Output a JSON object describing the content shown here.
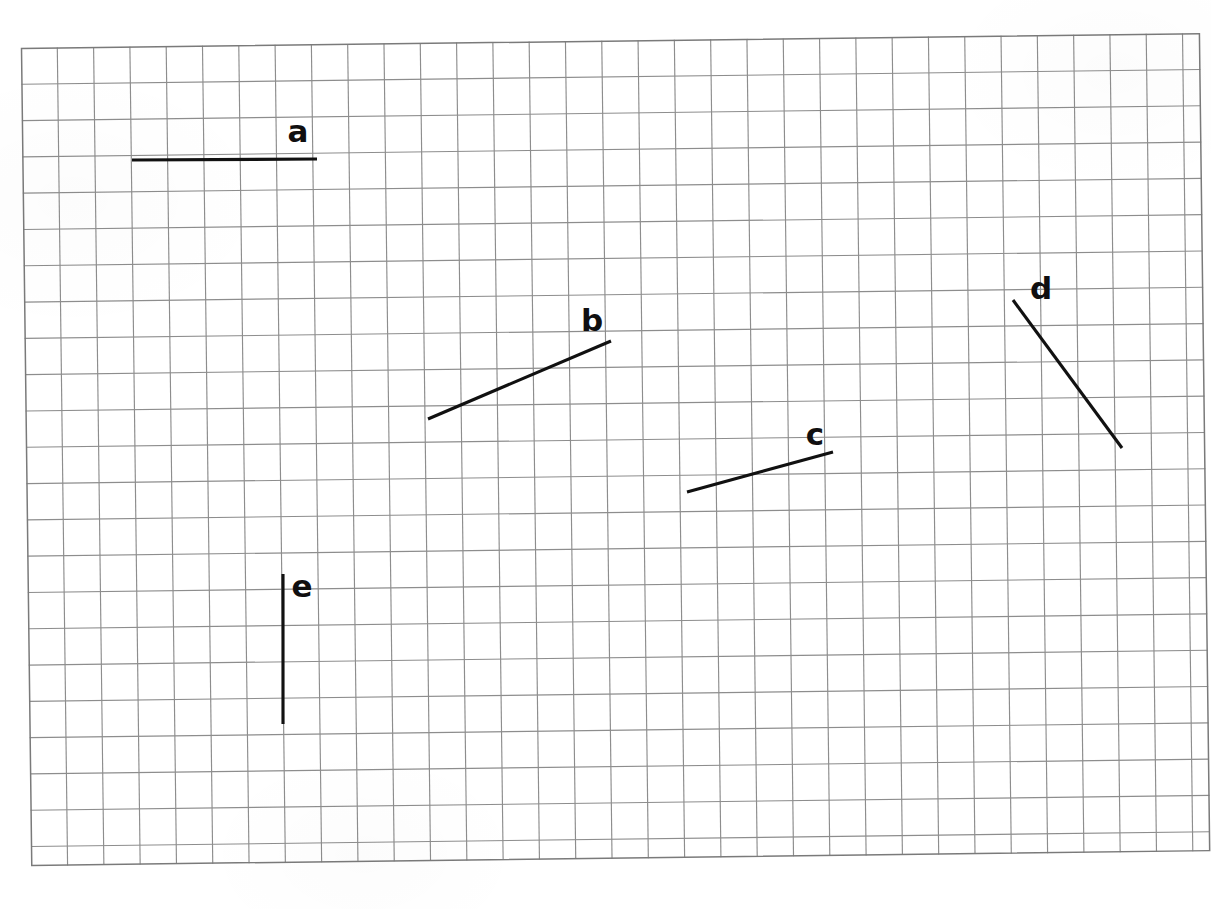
{
  "worksheet": {
    "background_color": "#ffffff",
    "description": "Grid paper with five labelled straight line segments"
  },
  "grid": {
    "line_color": "#8d8d8d",
    "border_color": "#7a7a7a",
    "cell_size_px": 36.3,
    "columns": 32,
    "rows": 22,
    "origin_x_px": 21,
    "origin_y_px": 48,
    "width_px": 1179,
    "height_px": 818,
    "rotation_deg": -0.72
  },
  "chart_data": {
    "type": "scatter",
    "title": "",
    "xlabel": "",
    "ylabel": "",
    "grid": true,
    "legend": "none",
    "units": "grid squares",
    "cell_size_px": 36.3,
    "xlim": [
      0,
      32
    ],
    "ylim": [
      0,
      22
    ],
    "segments": [
      {
        "label": "a",
        "orientation": "horizontal",
        "x1_px": 132,
        "y1_px": 160,
        "x2_px": 317,
        "y2_px": 159,
        "x1_cells": 3.1,
        "y1_cells": 3.1,
        "x2_cells": 8.2,
        "y2_cells": 3.1,
        "length_cells": 5.1,
        "label_x_px": 298,
        "label_y_px": 131
      },
      {
        "label": "b",
        "orientation": "diagonal-up",
        "x1_px": 428,
        "y1_px": 419,
        "x2_px": 611,
        "y2_px": 341,
        "x1_cells": 11.3,
        "y1_cells": 10.3,
        "x2_cells": 16.3,
        "y2_cells": 8.1,
        "length_cells": 5.5,
        "label_x_px": 592,
        "label_y_px": 320
      },
      {
        "label": "c",
        "orientation": "diagonal-up",
        "x1_px": 687,
        "y1_px": 492,
        "x2_px": 833,
        "y2_px": 452,
        "x1_cells": 18.4,
        "y1_cells": 12.3,
        "x2_cells": 22.4,
        "y2_cells": 11.2,
        "length_cells": 4.1,
        "label_x_px": 815,
        "label_y_px": 434
      },
      {
        "label": "d",
        "orientation": "diagonal-down",
        "x1_px": 1013,
        "y1_px": 300,
        "x2_px": 1122,
        "y2_px": 448,
        "x1_cells": 27.4,
        "y1_cells": 7.0,
        "x2_cells": 30.4,
        "y2_cells": 11.1,
        "length_cells": 5.1,
        "label_x_px": 1041,
        "label_y_px": 288
      },
      {
        "label": "e",
        "orientation": "vertical",
        "x1_px": 283,
        "y1_px": 574,
        "x2_px": 283,
        "y2_px": 724,
        "x1_cells": 7.2,
        "y1_cells": 14.5,
        "x2_cells": 7.2,
        "y2_cells": 18.6,
        "length_cells": 4.1,
        "label_x_px": 302,
        "label_y_px": 586
      }
    ]
  },
  "labels": {
    "a": "a",
    "b": "b",
    "c": "c",
    "d": "d",
    "e": "e"
  }
}
